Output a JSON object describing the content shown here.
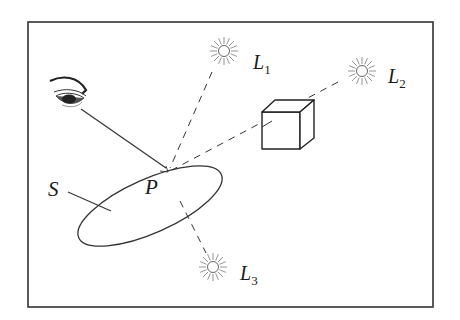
{
  "diagram": {
    "labels": {
      "L1": {
        "main": "L",
        "sub": "1"
      },
      "L2": {
        "main": "L",
        "sub": "2"
      },
      "L3": {
        "main": "L",
        "sub": "3"
      },
      "P": "P",
      "S": "S"
    },
    "elements": [
      {
        "id": "eye",
        "kind": "viewer"
      },
      {
        "id": "L1",
        "kind": "light-source"
      },
      {
        "id": "L2",
        "kind": "light-source",
        "occluded_by": "cube"
      },
      {
        "id": "L3",
        "kind": "light-source",
        "behind_surface": true
      },
      {
        "id": "cube",
        "kind": "occluder"
      },
      {
        "id": "S",
        "kind": "surface"
      },
      {
        "id": "P",
        "kind": "point"
      }
    ],
    "colors": {
      "stroke": "#222222",
      "background": "#ffffff",
      "sun": "#888888"
    }
  }
}
